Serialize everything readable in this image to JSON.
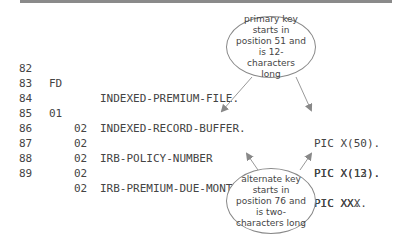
{
  "lines": [
    {
      "num": "82",
      "level": "FD",
      "name": "INDEXED-PREMIUM-FILE.",
      "pic": ""
    },
    {
      "num": "83",
      "level": "",
      "name": "",
      "pic": ""
    },
    {
      "num": "84",
      "level": "01",
      "name": "INDEXED-RECORD-BUFFER.",
      "pic": ""
    },
    {
      "num": "85",
      "level": "02",
      "name": "",
      "pic": "PIC X(50)."
    },
    {
      "num": "86",
      "level": "02",
      "name": "IRB-POLICY-NUMBER",
      "pic": "PIC X(12)."
    },
    {
      "num": "87",
      "level": "02",
      "name": "",
      "pic": "PIC X(13)."
    },
    {
      "num": "88",
      "level": "02",
      "name": "IRB-PREMIUM-DUE-MONTH",
      "pic": "PIC XX."
    },
    {
      "num": "89",
      "level": "02",
      "name": "",
      "pic": "PIC XXX."
    }
  ],
  "callouts": {
    "primary": "primary key starts in position 51 and is 12-characters long",
    "alternate": "alternate key starts in position 76 and is two-characters long"
  }
}
